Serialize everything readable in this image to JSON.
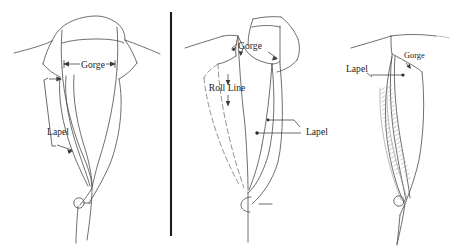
{
  "figure": {
    "background_color": "#ffffff",
    "ink_color": "#4a4a4a",
    "label_color": "#1d1d1d",
    "divider_color": "#1c1c1c",
    "panel_count": 3
  },
  "panels": [
    {
      "id": "panel-left",
      "name": "notch-lapel-front-view",
      "labels": [
        {
          "id": "gorge",
          "text": "Gorge",
          "x": 93,
          "y": 68,
          "annotation": "double-headed-arrow"
        },
        {
          "id": "lapel",
          "text": "Lapel",
          "x": 58,
          "y": 135,
          "annotation": "bracket-arrow"
        }
      ],
      "button": {
        "name": "button-circle",
        "cx": 79,
        "cy": 203,
        "r": 5.2
      }
    },
    {
      "id": "panel-middle",
      "name": "lapel-roll-line-three-quarter-view",
      "labels": [
        {
          "id": "gorge",
          "text": "Gorge",
          "x": 250,
          "y": 49,
          "annotation": "two-arrows"
        },
        {
          "id": "roll-line",
          "text": "Roll Line",
          "x": 227,
          "y": 91,
          "annotation": "two-arrows-vertical"
        },
        {
          "id": "lapel",
          "text": "Lapel",
          "x": 306,
          "y": 131,
          "annotation": "two-leader-lines"
        }
      ],
      "button": {
        "name": "button-circle",
        "cx": 247,
        "cy": 203,
        "r": 5.0
      }
    },
    {
      "id": "panel-right",
      "name": "lapel-padstitched-side-view",
      "labels": [
        {
          "id": "gorge",
          "text": "Gorge",
          "x": 404,
          "y": 58,
          "annotation": "short-arrow"
        },
        {
          "id": "lapel",
          "text": "Lapel",
          "x": 346,
          "y": 72,
          "annotation": "long-horizontal-arrow"
        }
      ],
      "button": {
        "name": "button-circle",
        "cx": 399,
        "cy": 201,
        "r": 5.2
      }
    }
  ],
  "divider": {
    "name": "panel-divider",
    "x": 171,
    "y_top": 12,
    "y_bottom": 236
  }
}
